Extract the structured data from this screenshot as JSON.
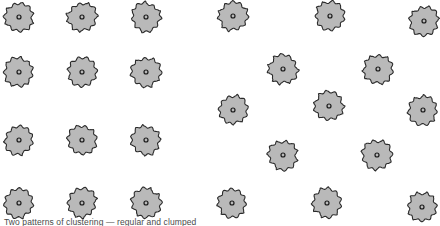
{
  "figure": {
    "title": "",
    "caption": "Two patterns of clustering — regular and clumped",
    "width": 440,
    "height": 226,
    "background_color": "#ffffff"
  },
  "symbol": {
    "name": "scalloped-blob-with-center-dot",
    "fill_color": "#b9b9b9",
    "outline_color": "#2b2b2b",
    "outline_width": 1.1,
    "center_dot_fill": "#b9b9b9",
    "center_dot_outline": "#1a1a1a",
    "diameter": 30,
    "center_dot_diameter": 4,
    "lobes": 11
  },
  "chart_data": {
    "type": "scatter",
    "title": "",
    "subtitle": "",
    "xlabel": "",
    "ylabel": "",
    "xlim": [
      0,
      440
    ],
    "ylim": [
      0,
      226
    ],
    "grid": false,
    "legend_position": "none",
    "axes_visible": false,
    "annotations": [
      "Two patterns of clustering — regular and clumped"
    ],
    "series": [
      {
        "name": "regular pattern (left group)",
        "marker": "scalloped-blob-with-center-dot",
        "color": "#b9b9b9",
        "points": [
          {
            "x": 19,
            "y": 17
          },
          {
            "x": 82,
            "y": 17
          },
          {
            "x": 146,
            "y": 17
          },
          {
            "x": 19,
            "y": 72
          },
          {
            "x": 82,
            "y": 72
          },
          {
            "x": 146,
            "y": 72
          },
          {
            "x": 19,
            "y": 140
          },
          {
            "x": 82,
            "y": 140
          },
          {
            "x": 146,
            "y": 140
          },
          {
            "x": 19,
            "y": 203
          },
          {
            "x": 82,
            "y": 203
          },
          {
            "x": 146,
            "y": 203
          }
        ]
      },
      {
        "name": "clumped pattern (right group)",
        "marker": "scalloped-blob-with-center-dot",
        "color": "#b9b9b9",
        "points": [
          {
            "x": 233,
            "y": 16
          },
          {
            "x": 330,
            "y": 16
          },
          {
            "x": 424,
            "y": 21
          },
          {
            "x": 283,
            "y": 69
          },
          {
            "x": 378,
            "y": 69
          },
          {
            "x": 233,
            "y": 110
          },
          {
            "x": 329,
            "y": 106
          },
          {
            "x": 423,
            "y": 110
          },
          {
            "x": 283,
            "y": 155
          },
          {
            "x": 377,
            "y": 155
          },
          {
            "x": 232,
            "y": 203
          },
          {
            "x": 327,
            "y": 203
          },
          {
            "x": 422,
            "y": 207
          }
        ]
      }
    ]
  }
}
